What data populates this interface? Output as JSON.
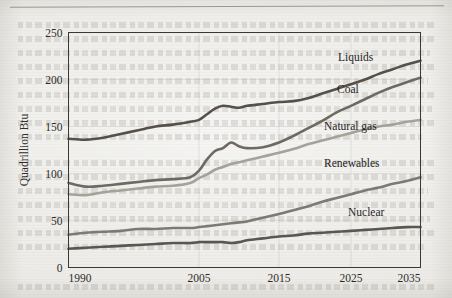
{
  "page": {
    "background_color": "#ecebe7",
    "has_top_rule": true,
    "medium": "scanned-book-page"
  },
  "chart_data": {
    "type": "line",
    "title": "",
    "subtitle": "",
    "xlabel": "",
    "ylabel": "Quadrillion Btu",
    "xlim": [
      1990,
      2035
    ],
    "ylim": [
      0,
      250
    ],
    "grid": true,
    "legend_position": "inline-annotations",
    "x_tick_labels": [
      "1990",
      "2005",
      "2015",
      "2025",
      "2035"
    ],
    "x_ticks": [
      1990,
      2005,
      2015,
      2025,
      2035
    ],
    "y_tick_labels": [
      "0",
      "50",
      "100",
      "150",
      "200",
      "250"
    ],
    "y_ticks": [
      0,
      50,
      100,
      150,
      200,
      250
    ],
    "x": [
      1990,
      1992,
      1994,
      1996,
      1998,
      2000,
      2002,
      2004,
      2005,
      2006,
      2007,
      2008,
      2009,
      2010,
      2011,
      2013,
      2015,
      2017,
      2019,
      2021,
      2023,
      2025,
      2027,
      2029,
      2031,
      2033,
      2035
    ],
    "series": [
      {
        "name": "Liquids",
        "color": "#565049",
        "values": [
          137,
          136,
          138,
          142,
          146,
          150,
          152,
          155,
          157,
          163,
          169,
          172,
          171,
          170,
          172,
          174,
          176,
          177,
          180,
          185,
          190,
          195,
          200,
          206,
          211,
          216,
          220
        ]
      },
      {
        "name": "Coal",
        "color": "#6e6963",
        "values": [
          90,
          86,
          87,
          89,
          91,
          93,
          94,
          96,
          103,
          115,
          124,
          127,
          133,
          129,
          127,
          128,
          133,
          140,
          148,
          156,
          165,
          172,
          179,
          186,
          192,
          197,
          202
        ]
      },
      {
        "name": "Natural gas",
        "color": "#a5a29a",
        "values": [
          78,
          77,
          80,
          82,
          84,
          86,
          87,
          90,
          95,
          99,
          104,
          107,
          110,
          112,
          114,
          118,
          122,
          126,
          131,
          135,
          139,
          143,
          147,
          150,
          152,
          155,
          157
        ]
      },
      {
        "name": "Renewables",
        "color": "#7e7a73",
        "values": [
          35,
          37,
          38,
          39,
          41,
          41,
          42,
          42,
          43,
          44,
          45,
          46,
          47,
          48,
          49,
          53,
          57,
          61,
          65,
          70,
          74,
          78,
          82,
          85,
          89,
          92,
          96
        ]
      },
      {
        "name": "Nuclear",
        "color": "#5b564f",
        "values": [
          20,
          21,
          22,
          23,
          24,
          25,
          26,
          26,
          27,
          27,
          27,
          27,
          26,
          27,
          29,
          31,
          33,
          34,
          36,
          37,
          38,
          39,
          40,
          41,
          42,
          43,
          43
        ]
      }
    ],
    "annotations": [
      {
        "text": "Liquids",
        "x_px": 338,
        "y_px": 61
      },
      {
        "text": "Coal",
        "x_px": 337,
        "y_px": 93
      },
      {
        "text": "Natural gas",
        "x_px": 324,
        "y_px": 130
      },
      {
        "text": "Renewables",
        "x_px": 324,
        "y_px": 167
      },
      {
        "text": "Nuclear",
        "x_px": 348,
        "y_px": 216
      }
    ]
  }
}
